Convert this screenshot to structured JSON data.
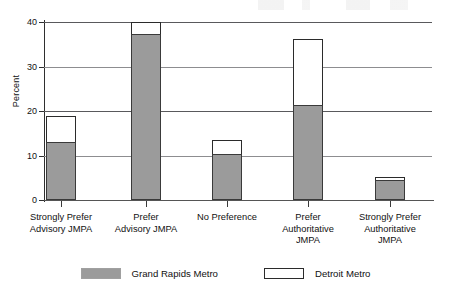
{
  "chart_data": {
    "type": "bar",
    "title": "",
    "subtitle": "",
    "xlabel": "",
    "ylabel": "Percent",
    "ylim": [
      0,
      40
    ],
    "yticks": [
      0,
      10,
      20,
      30,
      40
    ],
    "ytick_labels": [
      "0",
      "10",
      "20",
      "30",
      "40"
    ],
    "grid": true,
    "grid_axis": "y",
    "legend_position": "bottom-center",
    "bar_style": "overlaid",
    "categories": [
      "Strongly Prefer Advisory JMPA",
      "Prefer Advisory JMPA",
      "No Preference",
      "Prefer Authoritative JMPA",
      "Strongly Prefer Authoritative JMPA"
    ],
    "category_label_lines": [
      [
        "Strongly Prefer",
        "Advisory JMPA"
      ],
      [
        "Prefer",
        "Advisory JMPA"
      ],
      [
        "No Preference"
      ],
      [
        "Prefer",
        "Authoritative",
        "JMPA"
      ],
      [
        "Strongly Prefer",
        "Authoritative",
        "JMPA"
      ]
    ],
    "series": [
      {
        "name": "Grand Rapids Metro",
        "color": "#9b9b9b",
        "edge_color": "#3a3a3a",
        "values": [
          13.0,
          37.3,
          10.3,
          21.4,
          4.6
        ]
      },
      {
        "name": "Detroit Metro",
        "color": "#ffffff",
        "edge_color": "#2b2b2b",
        "values": [
          18.8,
          40.0,
          13.5,
          36.2,
          5.1
        ]
      }
    ]
  },
  "axis": {
    "y_title": "Percent"
  },
  "legend": {
    "entries": [
      {
        "label": "Grand Rapids Metro",
        "swatch": "gray-filled-swatch"
      },
      {
        "label": "Detroit Metro",
        "swatch": "white-outlined-swatch"
      }
    ]
  }
}
